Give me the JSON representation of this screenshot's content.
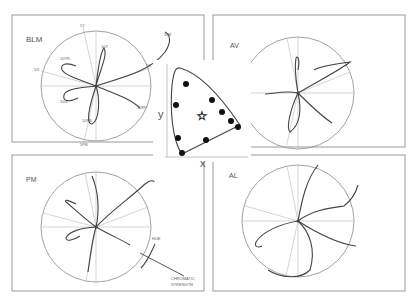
{
  "figure": {
    "panels": [
      {
        "id": "blm",
        "title": "BLM",
        "axis_labels": [
          "5Y",
          "5G",
          "5R",
          "5PB"
        ],
        "point_labels": [
          "10Y",
          "10R",
          "10G",
          "10YR",
          "10PB",
          "10RP"
        ]
      },
      {
        "id": "av",
        "title": "AV"
      },
      {
        "id": "pm",
        "title": "PM",
        "annotations": {
          "hue": "HUE",
          "chromatic_line1": "CHROMATIC",
          "chromatic_line2": "STRENGTH"
        }
      },
      {
        "id": "al",
        "title": "AL"
      }
    ],
    "chromaticity_chart": {
      "x_label": "x",
      "y_label": "y",
      "star_marker": "white-point",
      "dots": 10
    }
  }
}
